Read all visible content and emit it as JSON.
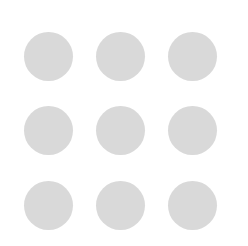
{
  "grid": {
    "rows": 3,
    "cols": 3,
    "dot_color": "#d9d9d9",
    "background": "#ffffff",
    "dots": [
      {
        "row": 1,
        "col": 1,
        "cx": 48,
        "cy": 56
      },
      {
        "row": 1,
        "col": 2,
        "cx": 120,
        "cy": 56
      },
      {
        "row": 1,
        "col": 3,
        "cx": 192,
        "cy": 56
      },
      {
        "row": 2,
        "col": 1,
        "cx": 48,
        "cy": 130
      },
      {
        "row": 2,
        "col": 2,
        "cx": 120,
        "cy": 130
      },
      {
        "row": 2,
        "col": 3,
        "cx": 192,
        "cy": 130
      },
      {
        "row": 3,
        "col": 1,
        "cx": 48,
        "cy": 205
      },
      {
        "row": 3,
        "col": 2,
        "cx": 120,
        "cy": 205
      },
      {
        "row": 3,
        "col": 3,
        "cx": 192,
        "cy": 205
      }
    ]
  }
}
